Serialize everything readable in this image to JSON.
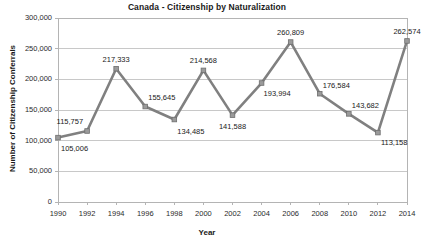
{
  "chart_data": {
    "type": "line",
    "title": "Canada - Citizenship by Naturalization",
    "xlabel": "Year",
    "ylabel": "Number of Citizenship Conferrals",
    "x": [
      1990,
      1992,
      1994,
      1996,
      1998,
      2000,
      2002,
      2004,
      2006,
      2008,
      2010,
      2012,
      2014
    ],
    "values": [
      105006,
      115757,
      217333,
      155645,
      134485,
      214568,
      141588,
      193994,
      260809,
      176584,
      143682,
      113158,
      262574
    ],
    "point_labels": [
      "105,006",
      "115,757",
      "217,333",
      "155,645",
      "134,485",
      "214,568",
      "141,588",
      "193,994",
      "260,809",
      "176,584",
      "143,682",
      "113,158",
      "262,574"
    ],
    "xticks": [
      "1990",
      "1992",
      "1994",
      "1996",
      "1998",
      "2000",
      "2002",
      "2004",
      "2006",
      "2008",
      "2010",
      "2012",
      "2014"
    ],
    "yticks": [
      "0",
      "50,000",
      "100,000",
      "150,000",
      "200,000",
      "250,000",
      "300,000"
    ],
    "ytick_values": [
      0,
      50000,
      100000,
      150000,
      200000,
      250000,
      300000
    ],
    "ylim": [
      0,
      300000
    ],
    "xlim": [
      1990,
      2014
    ],
    "grid": "horizontal",
    "legend": "none",
    "series_color": "#808080",
    "marker_color": "#9a9a9a",
    "grid_color": "#c8c8c8",
    "axis_color": "#b4b4b4",
    "text_color": "#1a1a1a"
  }
}
